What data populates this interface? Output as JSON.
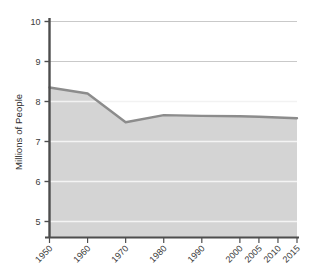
{
  "chart_data": {
    "type": "area",
    "title": "",
    "subtitle": "",
    "xlabel": "",
    "ylabel": "Millions of People",
    "categories": [
      "1950",
      "1960",
      "1970",
      "1980",
      "1990",
      "2000",
      "2005",
      "2010",
      "2015"
    ],
    "x": [
      1950,
      1960,
      1970,
      1980,
      1990,
      2000,
      2005,
      2010,
      2015
    ],
    "values": [
      8.35,
      8.2,
      7.48,
      7.66,
      7.64,
      7.63,
      7.62,
      7.6,
      7.58
    ],
    "series": [
      {
        "name": "Population",
        "values": [
          8.35,
          8.2,
          7.48,
          7.66,
          7.64,
          7.63,
          7.62,
          7.6,
          7.58
        ]
      }
    ],
    "ylim": [
      4.6,
      10.2
    ],
    "yticks": [
      5,
      6,
      7,
      8,
      9,
      10
    ],
    "ytick_labels": [
      "5",
      "6",
      "7",
      "8",
      "9",
      "10"
    ],
    "xtick_labels": [
      "1950",
      "1960",
      "1970",
      "1980",
      "1990",
      "2000",
      "2005",
      "2010",
      "2015"
    ],
    "grid": true,
    "grid_axis": "y",
    "legend": false,
    "legend_position": "none",
    "xtick_label_rotation": 45,
    "colors": {
      "line": "#8c8c8c",
      "fill": "#d4d4d4",
      "gridline_above_fill": "#c9c9c9",
      "gridline_over_fill": "#f2f2f2",
      "axis": "#4d4d4d",
      "tick_label": "#3a3a3a",
      "axis_title": "#2e2e2e",
      "background": "#ffffff"
    }
  },
  "axis": {
    "y_title": "Millions of People",
    "y_ticks": [
      {
        "label": "10",
        "value": 10
      },
      {
        "label": "9",
        "value": 9
      },
      {
        "label": "8",
        "value": 8
      },
      {
        "label": "7",
        "value": 7
      },
      {
        "label": "6",
        "value": 6
      },
      {
        "label": "5",
        "value": 5
      }
    ],
    "x_ticks": [
      {
        "label": "1950",
        "value": 1950
      },
      {
        "label": "1960",
        "value": 1960
      },
      {
        "label": "1970",
        "value": 1970
      },
      {
        "label": "1980",
        "value": 1980
      },
      {
        "label": "1990",
        "value": 1990
      },
      {
        "label": "2000",
        "value": 2000
      },
      {
        "label": "2005",
        "value": 2005
      },
      {
        "label": "2010",
        "value": 2010
      },
      {
        "label": "2015",
        "value": 2015
      }
    ]
  }
}
